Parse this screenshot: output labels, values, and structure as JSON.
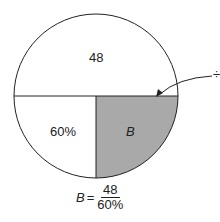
{
  "diagram": {
    "top_label": "48",
    "left_label": "60%",
    "shaded_label": "B",
    "arrow_symbol": "÷",
    "colors": {
      "shaded": "#a9a9a9",
      "stroke": "#222222"
    }
  },
  "formula": {
    "lhs": "B",
    "equals": "=",
    "numerator": "48",
    "denominator": "60%"
  }
}
